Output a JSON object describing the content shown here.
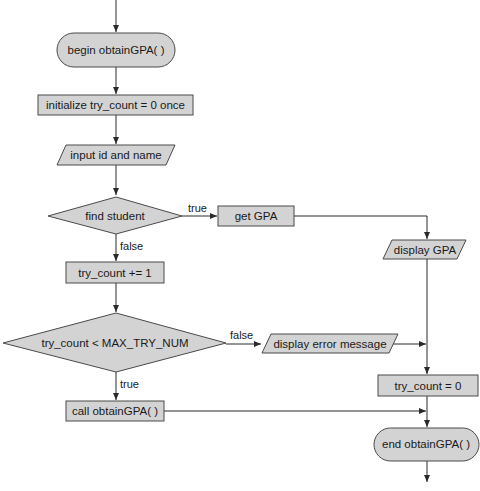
{
  "diagram": {
    "type": "flowchart",
    "colors": {
      "fill": "#d3d3d3",
      "stroke": "#4a4a4a",
      "line": "#2a2a2a",
      "background": "#ffffff"
    },
    "nodes": [
      {
        "id": "begin",
        "shape": "terminal",
        "label": "begin obtainGPA( )"
      },
      {
        "id": "init",
        "shape": "process",
        "label": "initialize try_count = 0 once"
      },
      {
        "id": "input",
        "shape": "io",
        "label": "input id and name"
      },
      {
        "id": "find",
        "shape": "decision",
        "label": "find student"
      },
      {
        "id": "get",
        "shape": "process",
        "label": "get GPA"
      },
      {
        "id": "display",
        "shape": "io",
        "label": "display GPA"
      },
      {
        "id": "inc",
        "shape": "process",
        "label": "try_count += 1"
      },
      {
        "id": "check",
        "shape": "decision",
        "label": "try_count < MAX_TRY_NUM"
      },
      {
        "id": "error",
        "shape": "io",
        "label": "display error message"
      },
      {
        "id": "reset",
        "shape": "process",
        "label": "try_count = 0"
      },
      {
        "id": "call",
        "shape": "process",
        "label": "call obtainGPA( )"
      },
      {
        "id": "end",
        "shape": "terminal",
        "label": "end obtainGPA( )"
      }
    ],
    "edges": [
      {
        "from": "begin",
        "to": "init",
        "label": ""
      },
      {
        "from": "init",
        "to": "input",
        "label": ""
      },
      {
        "from": "input",
        "to": "find",
        "label": ""
      },
      {
        "from": "find",
        "to": "get",
        "label": "true"
      },
      {
        "from": "find",
        "to": "inc",
        "label": "false"
      },
      {
        "from": "get",
        "to": "display",
        "label": ""
      },
      {
        "from": "display",
        "to": "reset",
        "label": ""
      },
      {
        "from": "inc",
        "to": "check",
        "label": ""
      },
      {
        "from": "check",
        "to": "error",
        "label": "false"
      },
      {
        "from": "check",
        "to": "call",
        "label": "true"
      },
      {
        "from": "error",
        "to": "reset",
        "label": ""
      },
      {
        "from": "reset",
        "to": "end",
        "label": ""
      },
      {
        "from": "call",
        "to": "end",
        "label": ""
      }
    ],
    "edge_labels": {
      "find_true": "true",
      "find_false": "false",
      "check_false": "false",
      "check_true": "true"
    }
  }
}
